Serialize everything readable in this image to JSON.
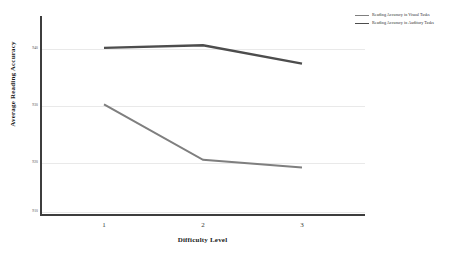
{
  "chart_data": {
    "type": "line",
    "title": "",
    "xlabel": "Difficulty Level",
    "ylabel": "Average Reading Accuracy",
    "categories": [
      "1",
      "2",
      "3"
    ],
    "x": [
      1,
      2,
      3
    ],
    "xlim": [
      0.4,
      3.9
    ],
    "ylim": [
      905,
      948
    ],
    "yticks": [
      940,
      930,
      920,
      910
    ],
    "ytick_labels": [
      "940",
      "930",
      "920",
      "910"
    ],
    "xtick_labels": [
      "1",
      "2",
      "3"
    ],
    "grid": true,
    "grid_axis": "y",
    "legend_position": "upper right outside",
    "series": [
      {
        "name": "Reading Accuracy in Visual Tasks",
        "color": "#7f7f7f",
        "values": [
          929.8,
          919.6,
          918.2
        ]
      },
      {
        "name": "Reading Accuracy in Auditory Tasks",
        "color": "#4d4d4d",
        "values": [
          940.2,
          940.7,
          937.3
        ]
      }
    ]
  },
  "axes": {
    "x_title": "Difficulty Level",
    "y_title": "Average Reading Accuracy",
    "ytick_0": "940",
    "ytick_1": "930",
    "ytick_2": "920",
    "ytick_3": "910",
    "xtick_0": "1",
    "xtick_1": "2",
    "xtick_2": "3"
  },
  "legend": {
    "entries": [
      {
        "label": "Reading Accuracy in Visual Tasks",
        "color": "#7f7f7f"
      },
      {
        "label": "Reading Accuracy in Auditory Tasks",
        "color": "#4d4d4d"
      }
    ],
    "entry_0_label": "Reading Accuracy in Visual Tasks",
    "entry_1_label": "Reading Accuracy in Auditory Tasks"
  },
  "colors": {
    "visual_series": "#7f7f7f",
    "auditory_series": "#4d4d4d",
    "axis": "#3d3d3d",
    "grid": "#e9e9e9",
    "background": "#ffffff"
  }
}
